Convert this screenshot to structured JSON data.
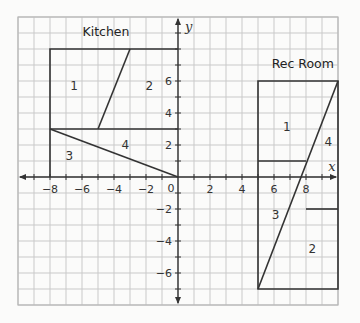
{
  "chart_data": {
    "type": "diagram",
    "title": "",
    "xlabel": "x",
    "ylabel": "y",
    "xlim": [
      -10,
      10
    ],
    "ylim": [
      -8,
      10
    ],
    "grid": true,
    "x_ticks": [
      -8,
      -6,
      -4,
      -2,
      2,
      4,
      6,
      8
    ],
    "y_ticks": [
      6,
      4,
      2,
      -2,
      -4,
      -6
    ],
    "origin_label": "0",
    "rooms": [
      {
        "name": "Kitchen",
        "label_pos": [
          -4.5,
          8.8
        ],
        "outline": [
          [
            -8,
            8
          ],
          [
            0,
            8
          ],
          [
            0,
            0
          ],
          [
            -8,
            0
          ]
        ],
        "outline_open_bottom": true,
        "segments": [
          [
            [
              -8,
              3
            ],
            [
              0,
              3
            ]
          ],
          [
            [
              -5,
              3
            ],
            [
              -3,
              8
            ]
          ],
          [
            [
              -8,
              3
            ],
            [
              0,
              0
            ]
          ]
        ],
        "regions": [
          {
            "label": "1",
            "pos": [
              -6.5,
              5.7
            ]
          },
          {
            "label": "2",
            "pos": [
              -1.8,
              5.7
            ]
          },
          {
            "label": "3",
            "pos": [
              -6.8,
              1.3
            ]
          },
          {
            "label": "4",
            "pos": [
              -3.3,
              2.0
            ]
          }
        ]
      },
      {
        "name": "Rec Room",
        "label_pos": [
          7.8,
          6.8
        ],
        "outline": [
          [
            5,
            6
          ],
          [
            10,
            6
          ],
          [
            10,
            -7
          ],
          [
            5,
            -7
          ]
        ],
        "segments": [
          [
            [
              5,
              1
            ],
            [
              8,
              1
            ]
          ],
          [
            [
              8,
              -2
            ],
            [
              10,
              -2
            ]
          ],
          [
            [
              5,
              -7
            ],
            [
              10,
              6
            ]
          ]
        ],
        "regions": [
          {
            "label": "1",
            "pos": [
              6.8,
              3.1
            ]
          },
          {
            "label": "4",
            "pos": [
              9.4,
              2.2
            ]
          },
          {
            "label": "3",
            "pos": [
              6.1,
              -2.4
            ]
          },
          {
            "label": "2",
            "pos": [
              8.4,
              -4.5
            ]
          }
        ]
      }
    ]
  }
}
